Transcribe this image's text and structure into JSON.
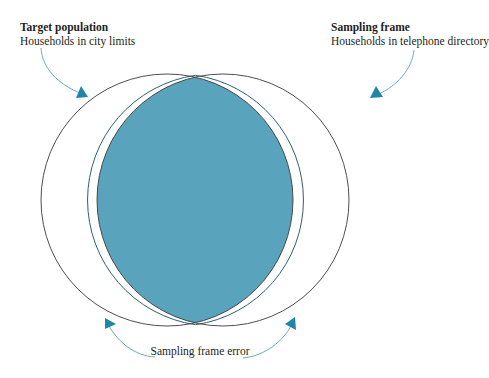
{
  "diagram": {
    "type": "venn",
    "colors": {
      "overlap_fill": "#5aa3bd",
      "overlap_stroke": "#2f5f70",
      "circle_stroke": "#3a3a3a",
      "arrow": "#2a8aa8",
      "background": "#ffffff"
    },
    "target_population": {
      "title": "Target population",
      "description": "Households in city limits"
    },
    "sampling_frame": {
      "title": "Sampling frame",
      "description": "Households in telephone directory"
    },
    "error_label": "Sampling frame error",
    "circles": [
      {
        "name": "target-population-circle",
        "cx": 167,
        "cy": 200,
        "r": 126
      },
      {
        "name": "sampling-frame-circle",
        "cx": 223,
        "cy": 200,
        "r": 126
      }
    ]
  }
}
